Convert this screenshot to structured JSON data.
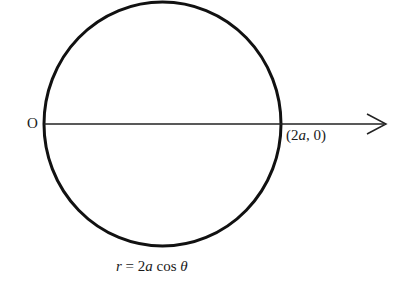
{
  "diagram": {
    "origin_label": "O",
    "point_label": {
      "open": "(",
      "coef": "2",
      "var": "a",
      "rest": ", 0)"
    },
    "caption": {
      "r": "r",
      "eq": " = 2",
      "a": "a",
      "cos": " cos ",
      "theta": "θ"
    },
    "shapes": {
      "circle": {
        "cx": 162.5,
        "cy": 124,
        "rx": 118.5,
        "ry": 122,
        "stroke": "#111111"
      },
      "axis": {
        "x1": 44,
        "y1": 124,
        "x2": 386,
        "y2": 124,
        "stroke": "#222222"
      }
    }
  }
}
